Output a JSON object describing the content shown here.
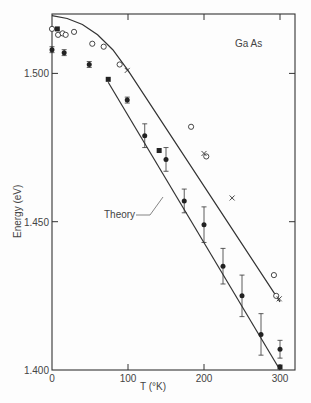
{
  "chart_data": {
    "type": "scatter",
    "title": "",
    "annotation": "Ga As",
    "theory_label": "Theory",
    "xlabel": "T (°K)",
    "ylabel": "Energy (eV)",
    "xlim": [
      0,
      315
    ],
    "ylim": [
      1.4,
      1.5195
    ],
    "xticks": [
      0,
      100,
      200,
      300
    ],
    "xtick_labels": [
      "0",
      "100",
      "200",
      "300"
    ],
    "yticks": [
      1.4,
      1.45,
      1.5
    ],
    "ytick_labels": [
      "1.400",
      "1.450",
      "1.500"
    ],
    "grid": false,
    "legend": null,
    "series": [
      {
        "name": "open circles",
        "marker": "open-circle",
        "points": [
          [
            0,
            1.515
          ],
          [
            8,
            1.513
          ],
          [
            14,
            1.5135
          ],
          [
            18,
            1.513
          ],
          [
            29,
            1.514
          ],
          [
            53,
            1.51
          ],
          [
            68,
            1.509
          ],
          [
            89,
            1.503
          ],
          [
            183,
            1.482
          ],
          [
            203,
            1.472
          ],
          [
            292,
            1.432
          ],
          [
            295,
            1.425
          ]
        ]
      },
      {
        "name": "crosses",
        "marker": "x",
        "points": [
          [
            99,
            1.501
          ],
          [
            200,
            1.473
          ],
          [
            237,
            1.458
          ],
          [
            299,
            1.424
          ]
        ]
      },
      {
        "name": "filled circles with error bars",
        "marker": "filled-circle",
        "points": [
          [
            0,
            1.508,
            0.001
          ],
          [
            16,
            1.507,
            0.001
          ],
          [
            49,
            1.503,
            0.001
          ],
          [
            99,
            1.491,
            0.001
          ],
          [
            122,
            1.479,
            0.004
          ],
          [
            150,
            1.471,
            0.004
          ],
          [
            174,
            1.457,
            0.004
          ],
          [
            200,
            1.449,
            0.006
          ],
          [
            225,
            1.435,
            0.006
          ],
          [
            250,
            1.425,
            0.007
          ],
          [
            275,
            1.412,
            0.007
          ],
          [
            300,
            1.407,
            0.003
          ]
        ]
      },
      {
        "name": "filled squares",
        "marker": "filled-square",
        "points": [
          [
            7,
            1.515
          ],
          [
            74,
            1.498
          ],
          [
            141,
            1.474
          ],
          [
            300,
            1.401
          ]
        ]
      }
    ],
    "curves": [
      {
        "name": "upper theory curve",
        "points": [
          [
            0,
            1.5195
          ],
          [
            20,
            1.5185
          ],
          [
            40,
            1.5165
          ],
          [
            60,
            1.513
          ],
          [
            80,
            1.508
          ],
          [
            100,
            1.501
          ],
          [
            300,
            1.423
          ]
        ]
      },
      {
        "name": "lower theory line",
        "points": [
          [
            74,
            1.497
          ],
          [
            300,
            1.4
          ]
        ]
      }
    ]
  }
}
